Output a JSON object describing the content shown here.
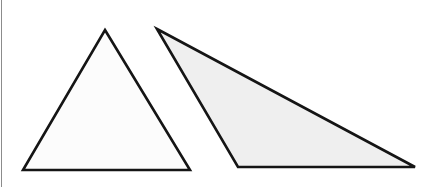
{
  "canvas": {
    "width": 440,
    "height": 187,
    "background_color": "#ffffff",
    "title": "Two triangles"
  },
  "frame": {
    "left_rule": {
      "name": "left margin rule",
      "color": "#8c8c8c",
      "x": 1.5,
      "y1": 0,
      "y2": 187,
      "thickness": 1.6
    }
  },
  "shapes": [
    {
      "id": "triangle-acute",
      "label": "Acute isosceles triangle",
      "type": "triangle",
      "classification": "acute",
      "fill_color": "#fcfcfc",
      "stroke_color": "#151515",
      "stroke_width": 2.6,
      "points": "105,30 190,170 23,170",
      "vertices": [
        {
          "name": "apex",
          "x": 105,
          "y": 30
        },
        {
          "name": "bottom-right",
          "x": 190,
          "y": 170
        },
        {
          "name": "bottom-left",
          "x": 23,
          "y": 170
        }
      ]
    },
    {
      "id": "triangle-obtuse",
      "label": "Obtuse scalene triangle",
      "type": "triangle",
      "classification": "obtuse",
      "fill_color": "#efefef",
      "stroke_color": "#151515",
      "stroke_width": 2.6,
      "points": "157,29 415,167 238,167",
      "vertices": [
        {
          "name": "apex",
          "x": 157,
          "y": 29
        },
        {
          "name": "bottom-right",
          "x": 415,
          "y": 167
        },
        {
          "name": "bottom-left",
          "x": 238,
          "y": 167
        }
      ]
    }
  ]
}
